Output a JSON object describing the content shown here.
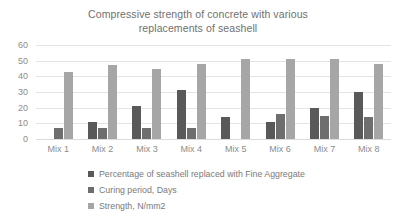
{
  "chart_data": {
    "type": "bar",
    "title": "Compressive strength of concrete with various replacements of seashell",
    "title_lines": [
      "Compressive strength of concrete with various",
      "replacements of seashell"
    ],
    "xlabel": "",
    "ylabel": "",
    "ylim": [
      0,
      60
    ],
    "ytick_step": 10,
    "yticks": [
      60,
      50,
      40,
      30,
      20,
      10,
      0
    ],
    "grid": true,
    "legend_position": "bottom-left",
    "categories": [
      "Mix 1",
      "Mix 2",
      "Mix 3",
      "Mix 4",
      "Mix 5",
      "Mix 6",
      "Mix 7",
      "Mix 8"
    ],
    "series": [
      {
        "name": "Percentage of seashell replaced with Fine Aggregate",
        "color": "#595959",
        "values": [
          0,
          11,
          21,
          31,
          14,
          11,
          20,
          30
        ]
      },
      {
        "name": "Curing period, Days",
        "color": "#6e6e6e",
        "values": [
          7,
          7,
          7,
          7,
          0,
          16,
          15,
          14
        ]
      },
      {
        "name": "Strength, N/mm2",
        "color": "#a6a6a6",
        "values": [
          43,
          47,
          45,
          48,
          51,
          51,
          51,
          48
        ]
      }
    ]
  },
  "legend": {
    "items": [
      {
        "label": "Percentage of seashell replaced with Fine Aggregate"
      },
      {
        "label": "Curing period, Days"
      },
      {
        "label": "Strength, N/mm2"
      }
    ]
  }
}
